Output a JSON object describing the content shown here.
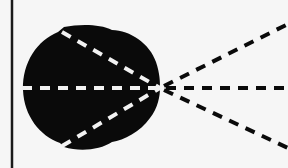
{
  "diagram": {
    "background": "#f6f6f6",
    "ink": "#0a0a0a",
    "inner_dash": "#f2f2f2",
    "vertical_line": {
      "x": 12,
      "y1": 0,
      "y2": 168
    },
    "apex": {
      "x": 160,
      "y": 88
    },
    "rays": [
      {
        "name": "upper",
        "inner_start": {
          "x": 62,
          "y": 32
        },
        "outer_end": {
          "x": 288,
          "y": 26
        }
      },
      {
        "name": "middle",
        "inner_start": {
          "x": 22,
          "y": 88
        },
        "outer_end": {
          "x": 288,
          "y": 88
        }
      },
      {
        "name": "lower",
        "inner_start": {
          "x": 62,
          "y": 146
        },
        "outer_end": {
          "x": 288,
          "y": 146
        }
      }
    ]
  }
}
